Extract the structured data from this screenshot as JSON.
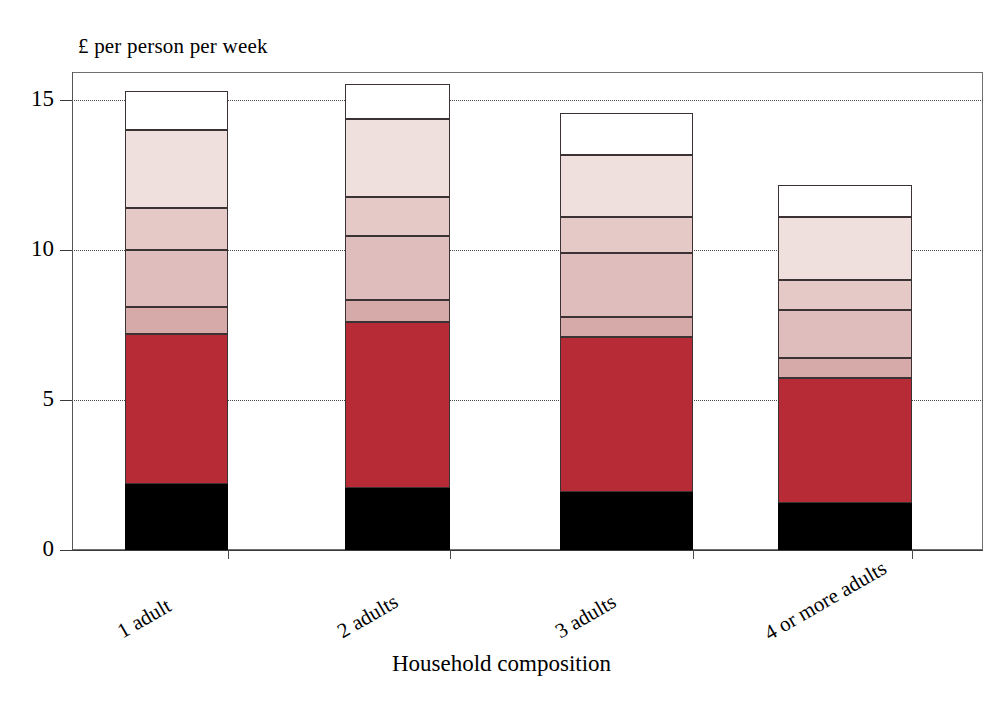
{
  "chart_data": {
    "type": "bar",
    "stacked": true,
    "title": "",
    "ylabel": "£ per person per week",
    "xlabel": "Household composition",
    "categories": [
      "1 adult",
      "2 adults",
      "3 adults",
      "4 or more  adults"
    ],
    "ylim": [
      0,
      16
    ],
    "yticks": [
      0,
      5,
      10,
      15
    ],
    "ytick_labels": [
      "0",
      "5",
      "10",
      "15"
    ],
    "grid": "horizontal-dotted",
    "legend": "none",
    "series": [
      {
        "name": "segment-1",
        "color": "#000000",
        "values": [
          2.2,
          2.07,
          1.93,
          1.57
        ]
      },
      {
        "name": "segment-2",
        "color": "#b62b36",
        "values": [
          5.0,
          5.53,
          5.17,
          4.17
        ]
      },
      {
        "name": "segment-3",
        "color": "#d7aaaa",
        "values": [
          0.9,
          0.73,
          0.67,
          0.67
        ]
      },
      {
        "name": "segment-4",
        "color": "#e0bdbd",
        "values": [
          1.9,
          2.13,
          2.13,
          1.6
        ]
      },
      {
        "name": "segment-5",
        "color": "#e5c9c6",
        "values": [
          1.4,
          1.3,
          1.2,
          1.0
        ]
      },
      {
        "name": "segment-6",
        "color": "#f0e0dd",
        "values": [
          2.6,
          2.6,
          2.07,
          2.1
        ]
      },
      {
        "name": "segment-7",
        "color": "#ffffff",
        "values": [
          1.3,
          1.17,
          1.4,
          1.07
        ]
      }
    ],
    "totals": [
      15.3,
      15.5,
      14.57,
      12.17
    ]
  },
  "axis": {
    "y_title": "£ per person per week",
    "x_title": "Household composition",
    "y_tick_labels": [
      "15",
      "10",
      "5",
      "0"
    ]
  },
  "colors": {
    "dark_red": "#b62b36",
    "black": "#000000",
    "outline": "#3b3234",
    "frame": "#6f6f6f",
    "grid": "#4a4a4a"
  }
}
